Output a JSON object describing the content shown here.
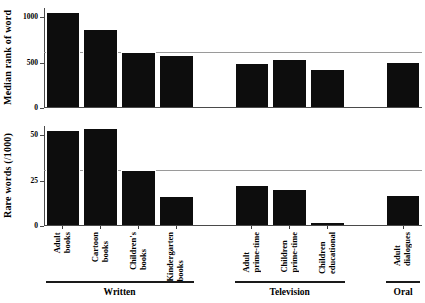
{
  "chart_data": {
    "type": "bar",
    "title": "",
    "categories": [
      "Adult books",
      "Cartoon books",
      "Children's books",
      "Kindergarten books",
      "Adult prime-time",
      "Children prime-time",
      "Children educational",
      "Adult dialogues"
    ],
    "category_lines": [
      [
        "Adult",
        "books"
      ],
      [
        "Cartoon",
        "books"
      ],
      [
        "Children's",
        "books"
      ],
      [
        "Kindergarten",
        "books"
      ],
      [
        "Adult",
        "prime-time"
      ],
      [
        "Children",
        "prime-time"
      ],
      [
        "Children",
        "educational"
      ],
      [
        "Adult",
        "dialogues"
      ]
    ],
    "groups": [
      {
        "name": "Written",
        "categories": [
          "Adult books",
          "Cartoon books",
          "Children's books",
          "Kindergarten books"
        ]
      },
      {
        "name": "Television",
        "categories": [
          "Adult prime-time",
          "Children prime-time",
          "Children educational"
        ]
      },
      {
        "name": "Oral",
        "categories": [
          "Adult dialogues"
        ]
      }
    ],
    "panels": [
      {
        "id": "median-rank",
        "ylabel": "Median rank of word",
        "ylim": [
          0,
          1100
        ],
        "yticks": [
          0,
          500,
          1000
        ],
        "ytick_labels": [
          "0",
          "500",
          "1000"
        ],
        "gridlines": [
          620
        ],
        "values": [
          1058,
          867,
          613,
          578,
          490,
          543,
          430,
          502
        ],
        "grid": true
      },
      {
        "id": "rare-words",
        "ylabel": "Rare words (/1000)",
        "ylim": [
          0,
          55
        ],
        "yticks": [
          0,
          25,
          50
        ],
        "ytick_labels": [
          "0",
          "25",
          "50"
        ],
        "gridlines": [
          30.9
        ],
        "values": [
          52.7,
          53.8,
          30.9,
          16.3,
          22.7,
          20.2,
          2.0,
          17.3
        ],
        "grid": true
      }
    ],
    "xlabel": "",
    "legend": [],
    "colors": {
      "bar": "#0d0d0d",
      "axis": "#4a4a4a",
      "gridline": "#9a9a9a",
      "background": "#ffffff",
      "text": "#000000"
    }
  }
}
